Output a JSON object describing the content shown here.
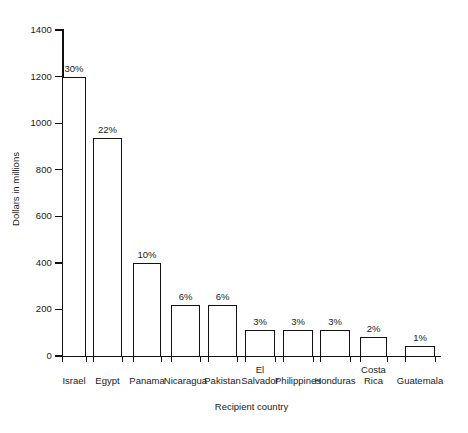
{
  "chart_data": {
    "type": "bar",
    "title": "",
    "xlabel": "Recipient country",
    "ylabel": "Dollars in millions",
    "ylim": [
      0,
      1400
    ],
    "yticks": [
      0,
      200,
      400,
      600,
      800,
      1000,
      1200,
      1400
    ],
    "ytick_labels": [
      "0",
      "200",
      "400",
      "600",
      "800",
      "1000",
      "1200",
      "1400"
    ],
    "grid": false,
    "legend": "none",
    "categories": [
      "Israel",
      "Egypt",
      "Panama",
      "Nicaragua",
      "Pakistan",
      "El\nSalvador",
      "Philippines",
      "Honduras",
      "Costa\nRica",
      "Guatemala"
    ],
    "values": [
      1200,
      935,
      400,
      220,
      220,
      110,
      110,
      110,
      80,
      45
    ],
    "data_labels": [
      "30%",
      "22%",
      "10%",
      "6%",
      "6%",
      "3%",
      "3%",
      "3%",
      "2%",
      "1%"
    ],
    "bar_style": {
      "fill": "#ffffff",
      "edge": "#111111",
      "edge_width_px": 1.5
    }
  },
  "axes": {
    "y_axis_color": "#111111",
    "x_axis_color": "#111111"
  }
}
